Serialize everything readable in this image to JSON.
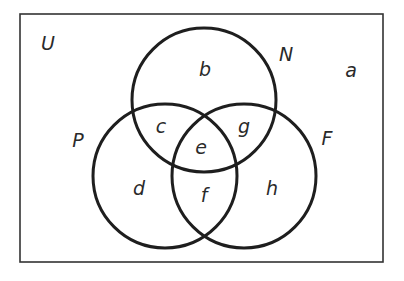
{
  "diagram": {
    "type": "venn",
    "universe_label": "U",
    "sets": [
      {
        "name": "N",
        "label": "N"
      },
      {
        "name": "P",
        "label": "P"
      },
      {
        "name": "F",
        "label": "F"
      }
    ],
    "regions": {
      "outside": "a",
      "N_only": "b",
      "N_and_P_only": "c",
      "P_only": "d",
      "N_P_F": "e",
      "P_and_F_only": "f",
      "N_and_F_only": "g",
      "F_only": "h"
    },
    "colors": {
      "stroke": "#1e1e1e",
      "background": "#ffffff",
      "text": "#2a2a2a"
    }
  }
}
